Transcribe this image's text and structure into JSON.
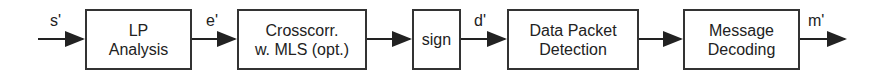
{
  "diagram": {
    "blocks": [
      {
        "id": "lp",
        "line1": "LP",
        "line2": "Analysis"
      },
      {
        "id": "xcorr",
        "line1": "Crosscorr.",
        "line2": "w. MLS (opt.)"
      },
      {
        "id": "sign",
        "line1": "sign",
        "line2": ""
      },
      {
        "id": "dpd",
        "line1": "Data Packet",
        "line2": "Detection"
      },
      {
        "id": "msg",
        "line1": "Message",
        "line2": "Decoding"
      }
    ],
    "signals": {
      "input": "s'",
      "after_lp": "e'",
      "after_sign": "d'",
      "output": "m'"
    }
  }
}
